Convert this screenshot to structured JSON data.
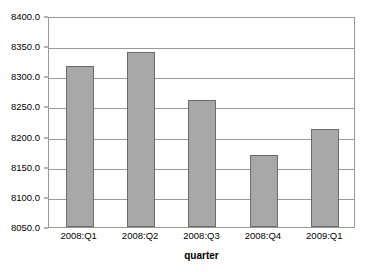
{
  "chart_data": {
    "type": "bar",
    "title": "",
    "subtitle": "",
    "xlabel": "quarter",
    "ylabel": "",
    "categories": [
      "2008:Q1",
      "2008:Q2",
      "2008:Q3",
      "2008:Q4",
      "2009:Q1"
    ],
    "values": [
      8317,
      8341,
      8260,
      8170,
      8212
    ],
    "series": [
      {
        "name": "",
        "values": [
          8317,
          8341,
          8260,
          8170,
          8212
        ]
      }
    ],
    "ylim": [
      8050,
      8400
    ],
    "ytick_step": 50,
    "ytick_labels": [
      "8400.0",
      "8350.0",
      "8300.0",
      "8250.0",
      "8200.0",
      "8150.0",
      "8100.0",
      "8050.0"
    ],
    "ytick_values": [
      8400,
      8350,
      8300,
      8250,
      8200,
      8150,
      8100,
      8050
    ],
    "grid": true,
    "grid_axis": "y",
    "legend": false,
    "legend_position": "none",
    "bar_color": "#a8a8a8",
    "bar_border_color": "#6b6b6b",
    "gridline_color": "#9a9a9a",
    "frame_color": "#999999",
    "background_color": "#ffffff"
  }
}
